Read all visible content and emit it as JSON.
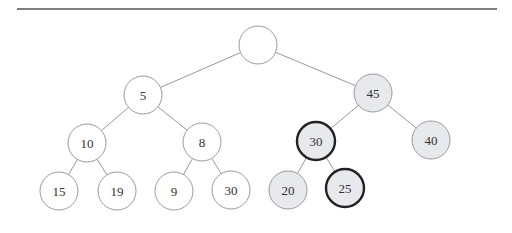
{
  "figure": {
    "type": "binary-heap-tree",
    "rule": {
      "x1": 17,
      "x2": 497,
      "y": 9,
      "color": "#555555"
    },
    "colors": {
      "edge": "#999999",
      "node_stroke": "#9a9a9a",
      "node_fill": "#ffffff",
      "highlight_fill": "#e8e9ec",
      "bold_stroke": "#222222"
    },
    "nodes": [
      {
        "id": "root",
        "label": "",
        "cx": 258,
        "cy": 45,
        "shaded": false,
        "bold": false
      },
      {
        "id": "n5",
        "label": "5",
        "cx": 143,
        "cy": 95,
        "shaded": false,
        "bold": false
      },
      {
        "id": "n45",
        "label": "45",
        "cx": 373,
        "cy": 93,
        "shaded": true,
        "bold": false
      },
      {
        "id": "n10",
        "label": "10",
        "cx": 87,
        "cy": 143,
        "shaded": false,
        "bold": false
      },
      {
        "id": "n8",
        "label": "8",
        "cx": 202,
        "cy": 142,
        "shaded": false,
        "bold": false
      },
      {
        "id": "n30a",
        "label": "30",
        "cx": 316,
        "cy": 141,
        "shaded": true,
        "bold": true
      },
      {
        "id": "n40",
        "label": "40",
        "cx": 431,
        "cy": 140,
        "shaded": true,
        "bold": false
      },
      {
        "id": "n15",
        "label": "15",
        "cx": 59,
        "cy": 191,
        "shaded": false,
        "bold": false
      },
      {
        "id": "n19",
        "label": "19",
        "cx": 117,
        "cy": 191,
        "shaded": false,
        "bold": false
      },
      {
        "id": "n9",
        "label": "9",
        "cx": 174,
        "cy": 191,
        "shaded": false,
        "bold": false
      },
      {
        "id": "n30b",
        "label": "30",
        "cx": 231,
        "cy": 190,
        "shaded": false,
        "bold": false
      },
      {
        "id": "n20",
        "label": "20",
        "cx": 288,
        "cy": 190,
        "shaded": true,
        "bold": false
      },
      {
        "id": "n25",
        "label": "25",
        "cx": 345,
        "cy": 188,
        "shaded": true,
        "bold": true
      }
    ],
    "edges": [
      [
        "root",
        "n5"
      ],
      [
        "root",
        "n45"
      ],
      [
        "n5",
        "n10"
      ],
      [
        "n5",
        "n8"
      ],
      [
        "n45",
        "n30a"
      ],
      [
        "n45",
        "n40"
      ],
      [
        "n10",
        "n15"
      ],
      [
        "n10",
        "n19"
      ],
      [
        "n8",
        "n9"
      ],
      [
        "n8",
        "n30b"
      ],
      [
        "n30a",
        "n20"
      ],
      [
        "n30a",
        "n25"
      ]
    ],
    "radius": 19
  }
}
